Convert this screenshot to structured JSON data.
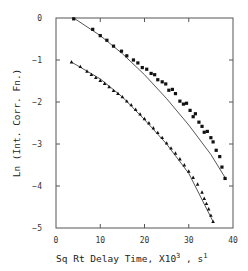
{
  "chart_data": {
    "type": "scatter",
    "title": "",
    "xlabel": "Sq Rt Delay Time, X10³ , s½",
    "xlabel_parts": {
      "main": "Sq Rt Delay Time,  X10",
      "sup1": "3",
      "mid": " ,  s",
      "sup2": "1"
    },
    "ylabel": "Ln (Int. Corr. Fn.)",
    "xlim": [
      0,
      40
    ],
    "ylim": [
      -5,
      0
    ],
    "xticks": [
      0,
      10,
      20,
      30,
      40
    ],
    "xtick_labels": [
      "0",
      "10",
      "20",
      "30",
      "40"
    ],
    "yticks": [
      0,
      -1,
      -2,
      -3,
      -4,
      -5
    ],
    "ytick_labels": [
      "0",
      "−1",
      "−2",
      "−3",
      "−4",
      "−5"
    ],
    "grid": false,
    "legend": null,
    "series": [
      {
        "name": "upper (square markers)",
        "marker": "square",
        "fit_line": [
          [
            4.0,
            0.0
          ],
          [
            10,
            -0.42
          ],
          [
            15,
            -0.85
          ],
          [
            20,
            -1.35
          ],
          [
            25,
            -1.92
          ],
          [
            30,
            -2.55
          ],
          [
            35,
            -3.25
          ],
          [
            38.5,
            -3.85
          ]
        ],
        "x": [
          4.0,
          8.3,
          10.0,
          11.5,
          13.0,
          14.8,
          16.0,
          17.5,
          18.5,
          19.5,
          20.5,
          21.5,
          22.3,
          23.0,
          24.0,
          24.8,
          25.5,
          26.3,
          27.0,
          28.0,
          28.8,
          29.5,
          30.3,
          31.0,
          31.5,
          32.3,
          33.0,
          33.5,
          34.2,
          35.0,
          35.5,
          36.2,
          37.0,
          37.5,
          38.2
        ],
        "y": [
          -0.02,
          -0.27,
          -0.42,
          -0.53,
          -0.67,
          -0.79,
          -0.9,
          -1.0,
          -1.07,
          -1.18,
          -1.22,
          -1.32,
          -1.35,
          -1.47,
          -1.52,
          -1.57,
          -1.72,
          -1.7,
          -1.8,
          -1.98,
          -2.05,
          -2.03,
          -2.2,
          -2.35,
          -2.28,
          -2.48,
          -2.58,
          -2.72,
          -2.7,
          -2.85,
          -2.95,
          -3.15,
          -3.3,
          -3.55,
          -3.82
        ]
      },
      {
        "name": "lower (triangle markers)",
        "marker": "triangle",
        "fit_line": [
          [
            3.5,
            -1.05
          ],
          [
            10,
            -1.45
          ],
          [
            15,
            -1.88
          ],
          [
            20,
            -2.42
          ],
          [
            25,
            -3.0
          ],
          [
            30,
            -3.7
          ],
          [
            35.5,
            -4.85
          ]
        ],
        "x": [
          3.5,
          5.5,
          7.0,
          8.0,
          9.0,
          10.0,
          11.0,
          12.0,
          13.0,
          14.0,
          15.0,
          16.0,
          17.0,
          18.0,
          19.0,
          20.0,
          21.0,
          22.0,
          23.0,
          24.0,
          25.0,
          26.0,
          27.0,
          28.0,
          29.0,
          30.0,
          31.0,
          32.0,
          33.0,
          33.5,
          34.0,
          34.5,
          35.0,
          35.5
        ],
        "y": [
          -1.05,
          -1.16,
          -1.27,
          -1.35,
          -1.42,
          -1.49,
          -1.56,
          -1.64,
          -1.73,
          -1.8,
          -1.88,
          -1.98,
          -2.07,
          -2.18,
          -2.29,
          -2.4,
          -2.5,
          -2.62,
          -2.73,
          -2.85,
          -2.98,
          -3.1,
          -3.22,
          -3.36,
          -3.5,
          -3.65,
          -3.8,
          -3.96,
          -4.15,
          -4.3,
          -4.42,
          -4.55,
          -4.7,
          -4.85
        ]
      }
    ]
  }
}
